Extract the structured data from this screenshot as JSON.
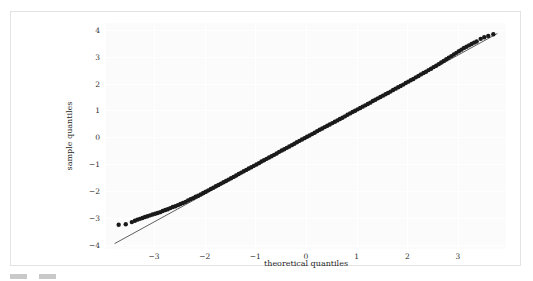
{
  "figure": {
    "background": "#fbfbfc",
    "card_border": "#e3e3e3",
    "point_color": "#1a1a1a",
    "line_color": "#4d4d4d",
    "grid_color": "#ffffff"
  },
  "caption": {
    "text": "",
    "swatch_color": "#c9c9c9"
  },
  "chart_data": {
    "type": "scatter",
    "title": "",
    "subtitle": "",
    "xlabel": "theoretical quantiles",
    "ylabel": "sample quantiles",
    "xlim": [
      -3.95,
      3.95
    ],
    "ylim": [
      -4.15,
      4.25
    ],
    "grid": true,
    "legend": null,
    "legend_position": "none",
    "xticks": [
      -3,
      -2,
      -1,
      0,
      1,
      2,
      3
    ],
    "xtick_labels": [
      "−3",
      "−2",
      "−1",
      "0",
      "1",
      "2",
      "3"
    ],
    "yticks": [
      -4,
      -3,
      -2,
      -1,
      0,
      1,
      2,
      3,
      4
    ],
    "ytick_labels": [
      "−4",
      "−3",
      "−2",
      "−1",
      "0",
      "1",
      "2",
      "3",
      "4"
    ],
    "annotations": [],
    "series": [
      {
        "name": "reference line",
        "type": "line",
        "x": [
          -3.78,
          3.78
        ],
        "y": [
          -3.95,
          3.86
        ]
      },
      {
        "name": "quantile points",
        "type": "scatter",
        "marker": "circle",
        "x": [
          -3.7,
          -3.56,
          -3.44,
          -3.38,
          -3.33,
          -3.28,
          -3.23,
          -3.18,
          -3.13,
          -3.08,
          -3.03,
          -2.98,
          -2.93,
          -2.88,
          -2.83,
          -2.78,
          -2.73,
          -2.68,
          -2.63,
          -2.58,
          -2.53,
          -2.48,
          -2.43,
          -2.38,
          -2.33,
          -2.28,
          -2.23,
          -2.18,
          -2.13,
          -2.08,
          -2.03,
          -1.98,
          -1.93,
          -1.88,
          -1.83,
          -1.78,
          -1.73,
          -1.68,
          -1.63,
          -1.58,
          -1.53,
          -1.48,
          -1.43,
          -1.38,
          -1.33,
          -1.28,
          -1.23,
          -1.18,
          -1.13,
          -1.08,
          -1.03,
          -0.98,
          -0.93,
          -0.88,
          -0.83,
          -0.78,
          -0.73,
          -0.68,
          -0.63,
          -0.58,
          -0.53,
          -0.48,
          -0.43,
          -0.38,
          -0.33,
          -0.28,
          -0.23,
          -0.18,
          -0.13,
          -0.08,
          -0.03,
          0.02,
          0.07,
          0.12,
          0.17,
          0.22,
          0.27,
          0.32,
          0.37,
          0.42,
          0.47,
          0.52,
          0.57,
          0.62,
          0.67,
          0.72,
          0.77,
          0.82,
          0.87,
          0.92,
          0.97,
          1.02,
          1.07,
          1.12,
          1.17,
          1.22,
          1.27,
          1.32,
          1.37,
          1.42,
          1.47,
          1.52,
          1.57,
          1.62,
          1.67,
          1.72,
          1.77,
          1.82,
          1.87,
          1.92,
          1.97,
          2.02,
          2.07,
          2.12,
          2.17,
          2.22,
          2.27,
          2.32,
          2.37,
          2.42,
          2.47,
          2.52,
          2.57,
          2.62,
          2.67,
          2.72,
          2.77,
          2.82,
          2.87,
          2.92,
          2.97,
          3.02,
          3.07,
          3.12,
          3.17,
          3.22,
          3.27,
          3.32,
          3.37,
          3.45,
          3.52,
          3.6,
          3.7
        ],
        "y": [
          -3.25,
          -3.23,
          -3.15,
          -3.1,
          -3.06,
          -3.03,
          -3.0,
          -2.96,
          -2.93,
          -2.9,
          -2.87,
          -2.84,
          -2.81,
          -2.78,
          -2.74,
          -2.7,
          -2.67,
          -2.63,
          -2.59,
          -2.56,
          -2.52,
          -2.48,
          -2.44,
          -2.4,
          -2.35,
          -2.3,
          -2.26,
          -2.21,
          -2.17,
          -2.12,
          -2.07,
          -2.02,
          -1.97,
          -1.92,
          -1.87,
          -1.82,
          -1.77,
          -1.72,
          -1.67,
          -1.62,
          -1.57,
          -1.52,
          -1.47,
          -1.42,
          -1.36,
          -1.31,
          -1.26,
          -1.21,
          -1.16,
          -1.11,
          -1.06,
          -1.01,
          -0.96,
          -0.9,
          -0.85,
          -0.8,
          -0.75,
          -0.7,
          -0.65,
          -0.6,
          -0.54,
          -0.49,
          -0.44,
          -0.39,
          -0.34,
          -0.29,
          -0.24,
          -0.18,
          -0.13,
          -0.08,
          -0.03,
          0.02,
          0.07,
          0.12,
          0.17,
          0.23,
          0.28,
          0.33,
          0.38,
          0.43,
          0.48,
          0.53,
          0.58,
          0.63,
          0.68,
          0.73,
          0.78,
          0.84,
          0.89,
          0.94,
          0.99,
          1.04,
          1.09,
          1.14,
          1.19,
          1.24,
          1.29,
          1.35,
          1.4,
          1.45,
          1.5,
          1.55,
          1.6,
          1.65,
          1.7,
          1.76,
          1.81,
          1.86,
          1.91,
          1.96,
          2.02,
          2.07,
          2.12,
          2.17,
          2.23,
          2.28,
          2.34,
          2.39,
          2.44,
          2.5,
          2.55,
          2.61,
          2.66,
          2.72,
          2.78,
          2.84,
          2.9,
          2.96,
          3.02,
          3.08,
          3.14,
          3.2,
          3.26,
          3.32,
          3.37,
          3.42,
          3.47,
          3.52,
          3.56,
          3.66,
          3.72,
          3.77,
          3.83
        ]
      }
    ]
  }
}
